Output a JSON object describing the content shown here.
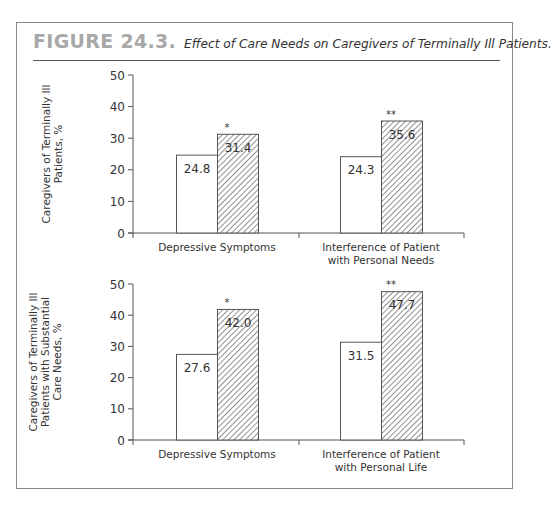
{
  "figure": {
    "number": "FIGURE 24.3.",
    "caption": "Effect of Care Needs on Caregivers of Terminally Ill Patients."
  },
  "colors": {
    "frame": "#8a8a8a",
    "axis": "#555555",
    "bar_outline": "#555555",
    "hatch": "#555555",
    "figure_number": "#a8a8a8"
  },
  "chart_data": [
    {
      "type": "bar",
      "title": "",
      "ylabel": "Caregivers of Terminally Ill Patients, %",
      "ylabel_lines": [
        "Caregivers of Terminally Ill",
        "Patients, %"
      ],
      "xlabel": "",
      "ylim": [
        0,
        50
      ],
      "yticks": [
        0,
        10,
        20,
        30,
        40,
        50
      ],
      "categories": [
        "Depressive Symptoms",
        "Interference of Patient with Personal Needs"
      ],
      "category_lines": [
        [
          "Depressive Symptoms"
        ],
        [
          "Interference of Patient",
          "with Personal Needs"
        ]
      ],
      "series": [
        {
          "name": "open bar",
          "pattern": "none",
          "values": [
            24.8,
            24.3
          ],
          "labels": [
            "24.8",
            "24.3"
          ]
        },
        {
          "name": "hatched bar",
          "pattern": "diagonal-hatch",
          "values": [
            31.4,
            35.6
          ],
          "labels": [
            "31.4",
            "35.6"
          ]
        }
      ],
      "annotations": [
        "*",
        "**"
      ],
      "grid": false,
      "legend": null
    },
    {
      "type": "bar",
      "title": "",
      "ylabel": "Caregivers of Terminally Ill Patients with Substantial Care Needs, %",
      "ylabel_lines": [
        "Caregivers of Terminally Ill",
        "Patients with Substantial",
        "Care Needs, %"
      ],
      "xlabel": "",
      "ylim": [
        0,
        50
      ],
      "yticks": [
        0,
        10,
        20,
        30,
        40,
        50
      ],
      "categories": [
        "Depressive Symptoms",
        "Interference of Patient with Personal Life"
      ],
      "category_lines": [
        [
          "Depressive Symptoms"
        ],
        [
          "Interference of Patient",
          "with Personal Life"
        ]
      ],
      "series": [
        {
          "name": "open bar",
          "pattern": "none",
          "values": [
            27.6,
            31.5
          ],
          "labels": [
            "27.6",
            "31.5"
          ]
        },
        {
          "name": "hatched bar",
          "pattern": "diagonal-hatch",
          "values": [
            42.0,
            47.7
          ],
          "labels": [
            "42.0",
            "47.7"
          ]
        }
      ],
      "annotations": [
        "*",
        "**"
      ],
      "grid": false,
      "legend": null
    }
  ]
}
